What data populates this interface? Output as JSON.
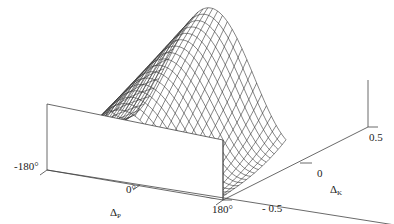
{
  "figure": {
    "type": "3d-wireframe-surface",
    "line_color": "#333333",
    "background": "#ffffff"
  },
  "axes": {
    "x": {
      "symbol": "Δ",
      "subscript": "P",
      "ticks": [
        "-180°",
        "0°",
        "180°"
      ]
    },
    "y": {
      "symbol": "Δ",
      "subscript": "K",
      "ticks": [
        "- 0.5",
        "0",
        "0.5"
      ]
    }
  },
  "chart_data": {
    "type": "surface",
    "title": "",
    "xlabel": "Δ_P",
    "ylabel": "Δ_K",
    "x_range": [
      -180,
      180
    ],
    "y_range": [
      -0.5,
      0.5
    ],
    "x_ticks": [
      -180,
      0,
      180
    ],
    "y_ticks": [
      -0.5,
      0,
      0.5
    ],
    "grid": false,
    "z_shape": "peak near Δ_P=0, decreasing as cos toward ±180°; ridge broadens/shifts with Δ_K"
  }
}
